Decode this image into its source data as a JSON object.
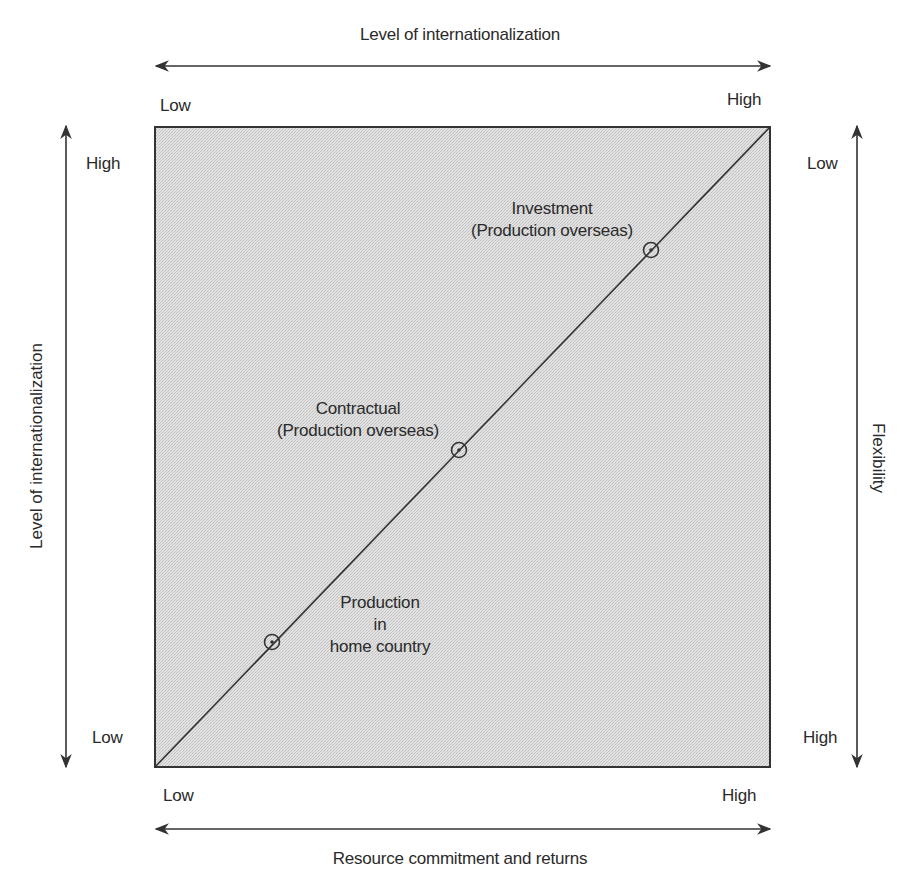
{
  "top_axis": {
    "title": "Level of internationalization",
    "low": "Low",
    "high": "High"
  },
  "bottom_axis": {
    "title": "Resource commitment and returns",
    "low": "Low",
    "high": "High"
  },
  "left_axis": {
    "title": "Level of internationalization",
    "high": "High",
    "low": "Low"
  },
  "right_axis": {
    "title": "Flexibility",
    "low": "Low",
    "high": "High"
  },
  "nodes": [
    {
      "line1": "Production",
      "line2": "in",
      "line3": "home country"
    },
    {
      "line1": "Contractual",
      "line2": "(Production overseas)"
    },
    {
      "line1": "Investment",
      "line2": "(Production overseas)"
    }
  ],
  "colors": {
    "panel_fill": "#d9d9d9",
    "stroke": "#333333",
    "text": "#2a2a2a"
  }
}
